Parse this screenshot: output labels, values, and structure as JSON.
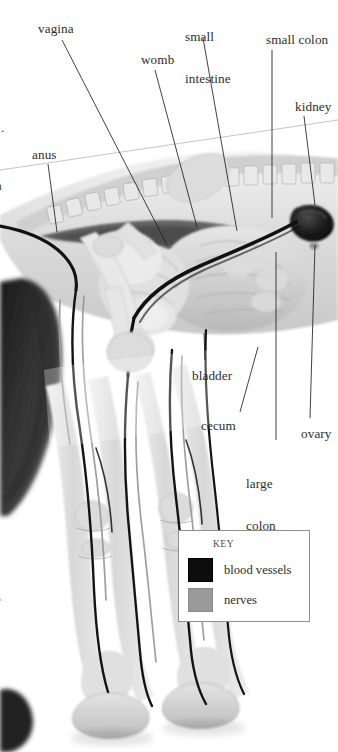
{
  "figure": {
    "kind": "anatomical-illustration",
    "style": "grayscale pencil / airbrush rendering"
  },
  "labels": [
    {
      "id": "vagina",
      "text": "vagina",
      "x": 38,
      "y": 22,
      "lines": [
        "vagina"
      ]
    },
    {
      "id": "small-intestine",
      "text": "small intestine",
      "x": 185,
      "y": 2,
      "lines": [
        "small",
        "intestine"
      ]
    },
    {
      "id": "small-colon",
      "text": "small colon",
      "x": 266,
      "y": 33,
      "lines": [
        "small colon"
      ]
    },
    {
      "id": "womb",
      "text": "womb",
      "x": 141,
      "y": 53,
      "lines": [
        "womb"
      ]
    },
    {
      "id": "kidney",
      "text": "kidney",
      "x": 295,
      "y": 100,
      "lines": [
        "kidney"
      ]
    },
    {
      "id": "anus",
      "text": "anus",
      "x": 32,
      "y": 148,
      "lines": [
        "anus"
      ]
    },
    {
      "id": "bladder",
      "text": "bladder",
      "x": 192,
      "y": 369,
      "lines": [
        "bladder"
      ]
    },
    {
      "id": "cecum",
      "text": "cecum",
      "x": 201,
      "y": 419,
      "lines": [
        "cecum"
      ]
    },
    {
      "id": "ovary",
      "text": "ovary",
      "x": 301,
      "y": 427,
      "lines": [
        "ovary"
      ]
    },
    {
      "id": "large-colon",
      "text": "large colon",
      "x": 246,
      "y": 449,
      "lines": [
        "large",
        "colon"
      ]
    }
  ],
  "leaders": [
    {
      "id": "leader-vagina",
      "x1": 62,
      "y1": 40,
      "x2": 167,
      "y2": 245
    },
    {
      "id": "leader-small-intestine",
      "x1": 203,
      "y1": 38,
      "x2": 237,
      "y2": 231
    },
    {
      "id": "leader-small-colon",
      "x1": 272,
      "y1": 50,
      "x2": 272,
      "y2": 218
    },
    {
      "id": "leader-womb",
      "x1": 155,
      "y1": 70,
      "x2": 197,
      "y2": 227
    },
    {
      "id": "leader-kidney",
      "x1": 304,
      "y1": 116,
      "x2": 315,
      "y2": 205
    },
    {
      "id": "leader-anus",
      "x1": 48,
      "y1": 164,
      "x2": 57,
      "y2": 232
    },
    {
      "id": "leader-bladder",
      "x1": 205,
      "y1": 360,
      "x2": 204,
      "y2": 333
    },
    {
      "id": "leader-cecum",
      "x1": 240,
      "y1": 412,
      "x2": 258,
      "y2": 347
    },
    {
      "id": "leader-large-colon",
      "x1": 276,
      "y1": 440,
      "x2": 276,
      "y2": 252
    },
    {
      "id": "leader-ovary",
      "x1": 310,
      "y1": 418,
      "x2": 315,
      "y2": 245
    }
  ],
  "guide_line": {
    "id": "page-guide",
    "x1": 0,
    "y1": 170,
    "x2": 338,
    "y2": 120
  },
  "legend": {
    "title": "KEY",
    "items": [
      {
        "id": "blood-vessels",
        "label": "blood vessels",
        "color": "#0d0d0d"
      },
      {
        "id": "nerves",
        "label": "nerves",
        "color": "#9a9a9a"
      }
    ]
  },
  "edge_marks": [
    {
      "id": "left-period-mark",
      "text": ".",
      "x": 1,
      "y": 120
    },
    {
      "id": "left-clip-letter",
      "text": "a",
      "x": 0,
      "y": 178
    },
    {
      "id": "left-clip-letter-2",
      "text": "e",
      "x": 0,
      "y": 592
    }
  ],
  "colors": {
    "ink": "#2d2d2d",
    "leader": "#1f1f1f",
    "legend_border": "#8e8e8e",
    "blood": "#0d0d0d",
    "nerve": "#9a9a9a",
    "background": "#ffffff"
  }
}
